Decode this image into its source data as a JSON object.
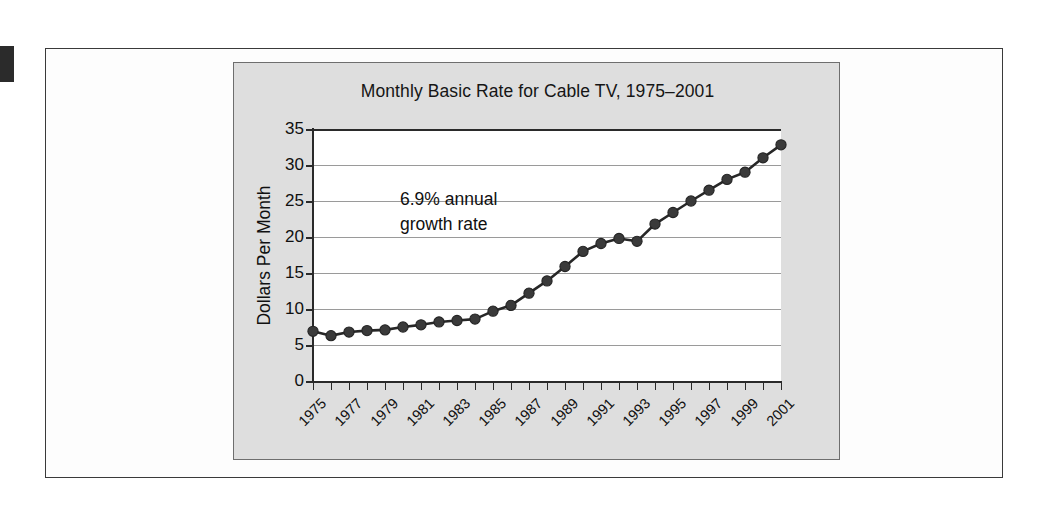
{
  "figure": {
    "panel_bg": "#dedede",
    "plot_bg": "#ffffff",
    "line_color": "#272727",
    "marker_color": "#3a3a3a",
    "grid_color": "#9a9a9a"
  },
  "annotation": {
    "line1": "6.9% annual",
    "line2": "growth rate"
  },
  "chart_data": {
    "type": "line",
    "title": "Monthly Basic Rate for Cable TV, 1975–2001",
    "xlabel": "",
    "ylabel": "Dollars Per Month",
    "ylim": [
      0,
      35
    ],
    "xlim": [
      1975,
      2001
    ],
    "yticks": [
      0,
      5,
      10,
      15,
      20,
      25,
      30,
      35
    ],
    "ytick_labels": [
      "0",
      "5",
      "10",
      "15",
      "20",
      "25",
      "30",
      "35"
    ],
    "xticks": [
      1975,
      1976,
      1977,
      1978,
      1979,
      1980,
      1981,
      1982,
      1983,
      1984,
      1985,
      1986,
      1987,
      1988,
      1989,
      1990,
      1991,
      1992,
      1993,
      1994,
      1995,
      1996,
      1997,
      1998,
      1999,
      2000,
      2001
    ],
    "xtick_labels": [
      "1975",
      "1977",
      "1979",
      "1981",
      "1983",
      "1985",
      "1987",
      "1989",
      "1991",
      "1993",
      "1995",
      "1997",
      "1999",
      "2001"
    ],
    "xtick_labels_every": 2,
    "grid": true,
    "grid_axis": "y",
    "legend": false,
    "annotations": [
      "6.9% annual growth rate"
    ],
    "x": [
      1975,
      1976,
      1977,
      1978,
      1979,
      1980,
      1981,
      1982,
      1983,
      1984,
      1985,
      1986,
      1987,
      1988,
      1989,
      1990,
      1991,
      1992,
      1993,
      1994,
      1995,
      1996,
      1997,
      1998,
      1999,
      2000,
      2001
    ],
    "values": [
      6.9,
      6.3,
      6.8,
      7.0,
      7.1,
      7.5,
      7.8,
      8.2,
      8.4,
      8.6,
      9.7,
      10.5,
      12.2,
      13.9,
      15.9,
      18.0,
      19.1,
      19.8,
      19.4,
      21.8,
      23.4,
      25.0,
      26.5,
      28.0,
      29.0,
      31.0,
      32.8
    ],
    "series": [
      {
        "name": "Monthly basic rate",
        "values": [
          6.9,
          6.3,
          6.8,
          7.0,
          7.1,
          7.5,
          7.8,
          8.2,
          8.4,
          8.6,
          9.7,
          10.5,
          12.2,
          13.9,
          15.9,
          18.0,
          19.1,
          19.8,
          19.4,
          21.8,
          23.4,
          25.0,
          26.5,
          28.0,
          29.0,
          31.0,
          32.8
        ]
      }
    ]
  }
}
